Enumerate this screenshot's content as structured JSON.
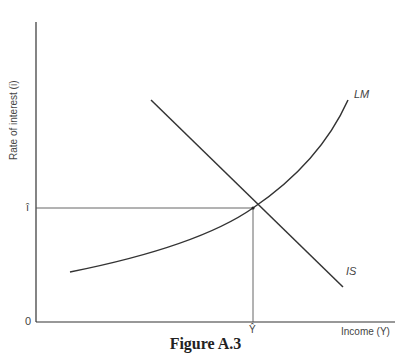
{
  "figure": {
    "caption": "Figure A.3",
    "y_axis_label": "Rate of interest (i)",
    "x_axis_label": "Income (Y)",
    "origin_label": "0",
    "equilibrium_interest_label": "î",
    "equilibrium_income_label": "Ŷ",
    "curves": [
      {
        "name": "LM",
        "shape": "upward-sloping convex curve"
      },
      {
        "name": "IS",
        "shape": "downward-sloping straight line"
      }
    ],
    "equilibrium_point": "Intersection of IS and LM at (Ŷ, î)"
  },
  "colors": {
    "line": "#333333",
    "guide": "#555555",
    "background": "#ffffff"
  }
}
